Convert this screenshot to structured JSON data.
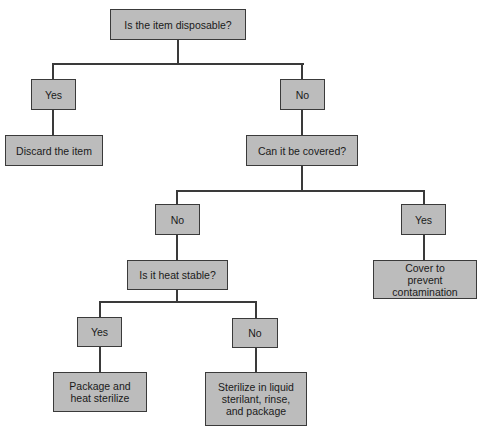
{
  "diagram": {
    "type": "decision-flowchart",
    "nodes": {
      "q_disposable": "Is the item disposable?",
      "a_disposable_yes": "Yes",
      "a_disposable_no": "No",
      "r_discard": "Discard the item",
      "q_covered": "Can it be covered?",
      "a_covered_no": "No",
      "a_covered_yes": "Yes",
      "r_cover": "Cover to prevent contamination",
      "q_heat_stable": "Is it heat stable?",
      "a_heat_yes": "Yes",
      "a_heat_no": "No",
      "r_heat_sterilize": "Package and heat sterilize",
      "r_liquid_sterilize": "Sterilize in liquid sterilant, rinse, and package"
    },
    "edges": [
      [
        "q_disposable",
        "a_disposable_yes"
      ],
      [
        "q_disposable",
        "a_disposable_no"
      ],
      [
        "a_disposable_yes",
        "r_discard"
      ],
      [
        "a_disposable_no",
        "q_covered"
      ],
      [
        "q_covered",
        "a_covered_no"
      ],
      [
        "q_covered",
        "a_covered_yes"
      ],
      [
        "a_covered_yes",
        "r_cover"
      ],
      [
        "a_covered_no",
        "q_heat_stable"
      ],
      [
        "q_heat_stable",
        "a_heat_yes"
      ],
      [
        "q_heat_stable",
        "a_heat_no"
      ],
      [
        "a_heat_yes",
        "r_heat_sterilize"
      ],
      [
        "a_heat_no",
        "r_liquid_sterilize"
      ]
    ],
    "colors": {
      "box_fill": "#bcbcbc",
      "box_border": "#3a3a3a",
      "line": "#3a3a3a"
    }
  }
}
